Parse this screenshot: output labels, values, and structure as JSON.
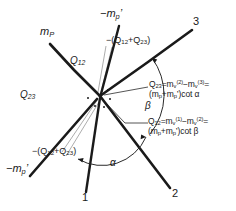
{
  "figure": {
    "type": "vector-kinematics-diagram",
    "background_color": "#ffffff",
    "ink_color": "#1a1a1a",
    "origin": {
      "x": 100,
      "y": 96
    }
  },
  "axis_labels": {
    "m_p_upper_left": "m",
    "m_p_upper_left_sub": "P",
    "minus_m_p_prime_top": "−m",
    "minus_m_p_prime_top_sub": "p",
    "minus_m_p_prime_top_prime": "’",
    "minus_m_p_prime_bottom_left": "−m",
    "minus_m_p_prime_bottom_left_sub": "p",
    "minus_m_p_prime_bottom_left_prime": "’",
    "ray_1": "1",
    "ray_2": "2",
    "ray_3": "3"
  },
  "segment_labels": {
    "q12": "Q",
    "q12_sub": "12",
    "q23": "Q",
    "q23_sub": "23"
  },
  "leader_annotations": [
    {
      "name": "neg-sum-top",
      "text": "−(Q",
      "sub1": "12",
      "mid": "+Q",
      "sub2": "23",
      "tail": ")"
    },
    {
      "name": "neg-sum-bottom-left",
      "text": "−(Q",
      "sub1": "12",
      "mid": "+Q",
      "sub2": "23",
      "tail": ")"
    }
  ],
  "angles": {
    "alpha": "α",
    "beta": "β"
  },
  "equations": {
    "q23_equation": {
      "lhs": "Q",
      "lhs_sub": "23",
      "eq1": "=m",
      "m1_sub": "v",
      "m1_sup": "(2)",
      "minus": "−m",
      "m2_sub": "v",
      "m2_sup": "(3)",
      "eq2": "=",
      "rhs_line2": "(m",
      "rhs_sub1": "p",
      "rhs_plus": "+m",
      "rhs_sub2": "p",
      "rhs_prime": "’",
      "rhs_tail": ")cot α"
    },
    "q12_equation": {
      "lhs": "Q",
      "lhs_sub": "12",
      "eq1": "=m",
      "m1_sub": "v",
      "m1_sup": "(1)",
      "minus": "−m",
      "m2_sub": "v",
      "m2_sup": "(2)",
      "eq2": "=",
      "rhs_line2": "(m",
      "rhs_sub1": "p",
      "rhs_plus": "+m",
      "rhs_sub2": "p",
      "rhs_prime": "’",
      "rhs_tail": ")cot β"
    }
  }
}
